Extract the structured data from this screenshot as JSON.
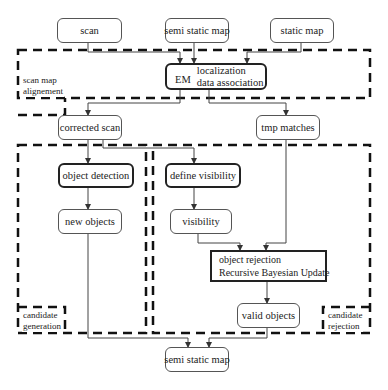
{
  "nodes": {
    "scan": "scan",
    "semi_static_map_in": "semi static map",
    "static_map": "static map",
    "em": "EM",
    "em_localization": "localization",
    "em_data_association": "data association",
    "corrected_scan": "corrected scan",
    "tmp_matches": "tmp matches",
    "object_detection": "object detection",
    "new_objects": "new objects",
    "define_visibility": "define visibility",
    "visibility": "visibility",
    "object_rejection": "object rejection",
    "recursive_bayesian_update": "Recursive Bayesian Update",
    "valid_objects": "valid objects",
    "semi_static_map_out": "semi static map"
  },
  "regions": {
    "scan_map_alignment_1": "scan map",
    "scan_map_alignment_2": "alignement",
    "candidate_generation_1": "candidate",
    "candidate_generation_2": "generation",
    "candidate_rejection_1": "candidate",
    "candidate_rejection_2": "rejection"
  }
}
